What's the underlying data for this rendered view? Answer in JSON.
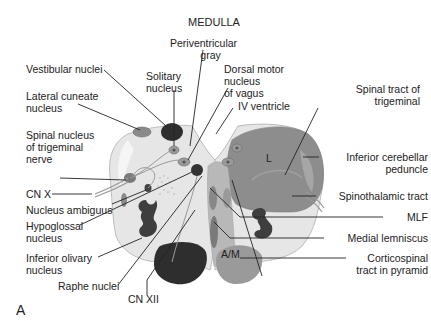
{
  "figure": {
    "title": "MEDULLA",
    "panel_letter": "A",
    "colors": {
      "background": "#ffffff",
      "tissue_light": "#e6e6e6",
      "tissue_outline": "#bdbdbd",
      "tract_region": "#8d8d8d",
      "tract_region_light": "#a6a6a6",
      "nucleus_dark": "#3a3a3a",
      "pyramid_left": "#2e2e2e",
      "pyramid_right": "#9a9a9a",
      "label_text": "#222222",
      "leader_line": "#222222"
    },
    "inside_labels": {
      "L": "L",
      "AM": "A/M"
    },
    "labels_left": [
      {
        "id": "vestibular",
        "lines": [
          "Vestibular nuclei"
        ]
      },
      {
        "id": "lateral-cuneate",
        "lines": [
          "Lateral cuneate",
          "nucleus"
        ]
      },
      {
        "id": "spinal-nucleus-trigeminal",
        "lines": [
          "Spinal nucleus",
          "of trigeminal",
          "nerve"
        ]
      },
      {
        "id": "cn-x",
        "lines": [
          "CN X"
        ]
      },
      {
        "id": "nucleus-ambiguus",
        "lines": [
          "Nucleus ambiguus"
        ]
      },
      {
        "id": "hypoglossal",
        "lines": [
          "Hypoglossal",
          "nucleus"
        ]
      },
      {
        "id": "inferior-olivary",
        "lines": [
          "Inferior olivary",
          "nucleus"
        ]
      },
      {
        "id": "raphe",
        "lines": [
          "Raphe nuclei"
        ]
      },
      {
        "id": "cn-xii",
        "lines": [
          "CN XII"
        ]
      }
    ],
    "labels_top": [
      {
        "id": "solitary",
        "lines": [
          "Solitary",
          "nucleus"
        ]
      },
      {
        "id": "periventricular",
        "lines": [
          "Periventricular",
          "gray"
        ]
      },
      {
        "id": "dorsal-motor-vagus",
        "lines": [
          "Dorsal motor",
          "nucleus",
          "of vagus"
        ]
      },
      {
        "id": "iv-ventricle",
        "lines": [
          "IV ventricle"
        ]
      }
    ],
    "labels_right": [
      {
        "id": "spinal-tract-trigeminal",
        "lines": [
          "Spinal tract of",
          "trigeminal"
        ]
      },
      {
        "id": "inferior-cerebellar-peduncle",
        "lines": [
          "Inferior cerebellar",
          "peduncle"
        ]
      },
      {
        "id": "spinothalamic",
        "lines": [
          "Spinothalamic tract"
        ]
      },
      {
        "id": "mlf",
        "lines": [
          "MLF"
        ]
      },
      {
        "id": "medial-lemniscus",
        "lines": [
          "Medial lemniscus"
        ]
      },
      {
        "id": "corticospinal",
        "lines": [
          "Corticospinal",
          "tract in pyramid"
        ]
      }
    ]
  }
}
